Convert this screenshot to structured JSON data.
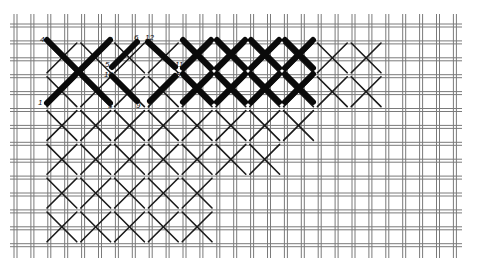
{
  "diagram": {
    "title": "",
    "colors": {
      "background": "#ffffff",
      "canvas_thread": "#7a7a7a",
      "stitch": "#111111"
    },
    "labels": [
      {
        "text": "4",
        "x": 40,
        "y": 42
      },
      {
        "text": "2",
        "x": 108,
        "y": 42
      },
      {
        "text": "6",
        "x": 134,
        "y": 40
      },
      {
        "text": "12",
        "x": 145,
        "y": 40
      },
      {
        "text": "5",
        "x": 105,
        "y": 67
      },
      {
        "text": "10",
        "x": 104,
        "y": 77
      },
      {
        "text": "11",
        "x": 175,
        "y": 67
      },
      {
        "text": "8",
        "x": 176,
        "y": 77
      },
      {
        "text": "1",
        "x": 38,
        "y": 105
      },
      {
        "text": "3",
        "x": 108,
        "y": 108
      },
      {
        "text": "9",
        "x": 136,
        "y": 108
      },
      {
        "text": "7",
        "x": 147,
        "y": 108
      }
    ]
  }
}
